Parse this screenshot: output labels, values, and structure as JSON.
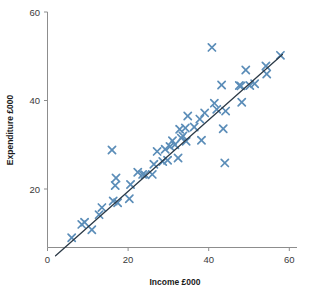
{
  "chart_data": {
    "type": "scatter",
    "title": "",
    "subtitle": "",
    "xlabel": "Income £000",
    "ylabel": "Expenditure £000",
    "xlim": [
      0,
      62
    ],
    "ylim": [
      0,
      62
    ],
    "xticks": [
      0,
      20,
      40,
      60
    ],
    "yticks": [
      20,
      40,
      60
    ],
    "xtick_labels": [
      "0",
      "20",
      "40",
      "60"
    ],
    "ytick_labels": [
      "20",
      "40",
      "60"
    ],
    "grid": false,
    "legend": false,
    "marker": "x",
    "marker_color": "#5b8db8",
    "line_color": "#2c3a47",
    "axis_color": "#8d8d8d",
    "series": [
      {
        "name": "Households",
        "points": [
          [
            6.0,
            9.0
          ],
          [
            8.5,
            12.0
          ],
          [
            9.2,
            12.5
          ],
          [
            11.0,
            10.8
          ],
          [
            12.8,
            14.2
          ],
          [
            13.5,
            15.8
          ],
          [
            16.0,
            28.8
          ],
          [
            16.3,
            17.3
          ],
          [
            16.8,
            20.8
          ],
          [
            17.0,
            22.5
          ],
          [
            17.4,
            16.9
          ],
          [
            20.3,
            17.8
          ],
          [
            20.6,
            21.0
          ],
          [
            22.4,
            23.8
          ],
          [
            23.6,
            23.3
          ],
          [
            24.2,
            23.2
          ],
          [
            26.0,
            23.3
          ],
          [
            26.4,
            25.6
          ],
          [
            27.2,
            28.5
          ],
          [
            28.6,
            26.2
          ],
          [
            29.2,
            29.0
          ],
          [
            29.8,
            26.5
          ],
          [
            30.4,
            29.6
          ],
          [
            31.0,
            30.9
          ],
          [
            31.6,
            30.0
          ],
          [
            32.4,
            27.0
          ],
          [
            32.8,
            33.5
          ],
          [
            33.2,
            31.5
          ],
          [
            33.6,
            32.0
          ],
          [
            34.2,
            33.8
          ],
          [
            34.4,
            30.8
          ],
          [
            34.8,
            36.5
          ],
          [
            36.4,
            34.0
          ],
          [
            37.8,
            35.8
          ],
          [
            38.2,
            31.0
          ],
          [
            39.0,
            37.2
          ],
          [
            40.8,
            52.0
          ],
          [
            41.4,
            39.4
          ],
          [
            42.0,
            38.0
          ],
          [
            43.2,
            43.5
          ],
          [
            43.6,
            33.6
          ],
          [
            44.0,
            25.9
          ],
          [
            44.2,
            37.6
          ],
          [
            47.6,
            43.4
          ],
          [
            48.0,
            43.3
          ],
          [
            48.2,
            39.6
          ],
          [
            49.2,
            46.9
          ],
          [
            50.2,
            43.4
          ],
          [
            51.4,
            43.8
          ],
          [
            54.2,
            47.8
          ],
          [
            54.4,
            46.0
          ],
          [
            57.8,
            50.2
          ]
        ]
      }
    ],
    "fit_line": {
      "name": "regression-line",
      "x_start": 2.0,
      "y_start": 4.9,
      "x_end": 58.3,
      "y_end": 50.4
    }
  }
}
